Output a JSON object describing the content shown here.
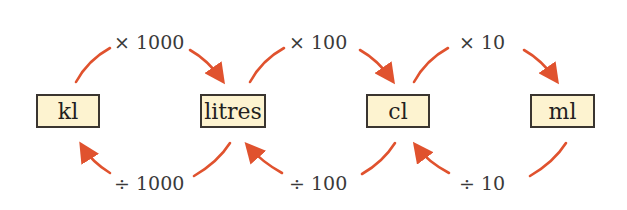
{
  "diagram": {
    "arrow_color": "#e0522e",
    "box_fill": "#fdf3d0",
    "box_border": "#3a3530",
    "units": [
      {
        "id": "kl",
        "label": "kl"
      },
      {
        "id": "litres",
        "label": "litres"
      },
      {
        "id": "cl",
        "label": "cl"
      },
      {
        "id": "ml",
        "label": "ml"
      }
    ],
    "conversions": [
      {
        "from": "kl",
        "to": "litres",
        "label": "× 1000"
      },
      {
        "from": "litres",
        "to": "kl",
        "label": "÷ 1000"
      },
      {
        "from": "litres",
        "to": "cl",
        "label": "× 100"
      },
      {
        "from": "cl",
        "to": "litres",
        "label": "÷ 100"
      },
      {
        "from": "cl",
        "to": "ml",
        "label": "× 10"
      },
      {
        "from": "ml",
        "to": "cl",
        "label": "÷ 10"
      }
    ]
  }
}
